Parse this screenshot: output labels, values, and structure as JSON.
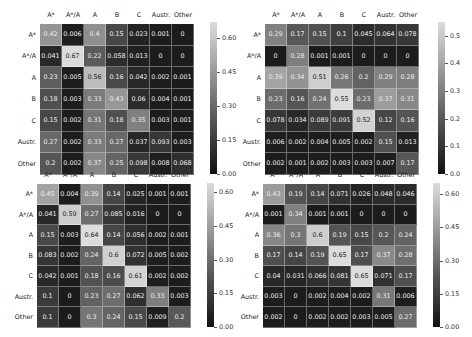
{
  "chart_data": [
    {
      "type": "heatmap",
      "position": "top-left",
      "x_labels": [
        "A*",
        "A*/A",
        "A",
        "B",
        "C",
        "Austr.",
        "Other"
      ],
      "y_labels": [
        "A*",
        "A*/A",
        "A",
        "B",
        "C",
        "Austr.",
        "Other"
      ],
      "values": [
        [
          0.42,
          0.006,
          0.4,
          0.15,
          0.023,
          0.001,
          0
        ],
        [
          0.041,
          0.67,
          0.22,
          0.058,
          0.013,
          0,
          0
        ],
        [
          0.23,
          0.005,
          0.56,
          0.16,
          0.042,
          0.002,
          0.001
        ],
        [
          0.18,
          0.003,
          0.33,
          0.43,
          0.06,
          0.004,
          0.001
        ],
        [
          0.15,
          0.002,
          0.31,
          0.18,
          0.35,
          0.003,
          0.001
        ],
        [
          0.27,
          0.002,
          0.33,
          0.27,
          0.037,
          0.093,
          0.003
        ],
        [
          0.2,
          0.002,
          0.37,
          0.25,
          0.098,
          0.008,
          0.068
        ]
      ],
      "colorbar_ticks": [
        "0.60",
        "0.45",
        "0.30",
        "0.15",
        "0.00"
      ],
      "vmin": 0,
      "vmax": 0.67
    },
    {
      "type": "heatmap",
      "position": "top-right",
      "x_labels": [
        "A*",
        "A*/A",
        "A",
        "B",
        "C",
        "Austr.",
        "Other"
      ],
      "y_labels": [
        "A*",
        "A*/A",
        "A",
        "B",
        "C",
        "Austr.",
        "Other"
      ],
      "values": [
        [
          0.29,
          0.17,
          0.15,
          0.1,
          0.045,
          0.064,
          0.078
        ],
        [
          0,
          0.28,
          0.001,
          0.001,
          0,
          0,
          0
        ],
        [
          0.39,
          0.34,
          0.51,
          0.26,
          0.2,
          0.29,
          0.28
        ],
        [
          0.23,
          0.16,
          0.24,
          0.55,
          0.23,
          0.37,
          0.31
        ],
        [
          0.078,
          0.034,
          0.089,
          0.091,
          0.52,
          0.12,
          0.16
        ],
        [
          0.006,
          0.002,
          0.004,
          0.005,
          0.002,
          0.15,
          0.013
        ],
        [
          0.002,
          0.001,
          0.002,
          0.003,
          0.003,
          0.007,
          0.17
        ]
      ],
      "colorbar_ticks": [
        "0.5",
        "0.4",
        "0.3",
        "0.2",
        "0.1",
        "0.0"
      ],
      "vmin": 0,
      "vmax": 0.55
    },
    {
      "type": "heatmap",
      "position": "bottom-left",
      "x_labels": [
        "A*",
        "A*/A",
        "A",
        "B",
        "C",
        "Austr.",
        "Other"
      ],
      "y_labels": [
        "A*",
        "A*/A",
        "A",
        "B",
        "C",
        "Austr.",
        "Other"
      ],
      "values": [
        [
          0.45,
          0.004,
          0.39,
          0.14,
          0.025,
          0.001,
          0.001
        ],
        [
          0.041,
          0.59,
          0.27,
          0.085,
          0.016,
          0,
          0
        ],
        [
          0.15,
          0.003,
          0.64,
          0.14,
          0.056,
          0.002,
          0.001
        ],
        [
          0.083,
          0.002,
          0.24,
          0.6,
          0.072,
          0.005,
          0.002
        ],
        [
          0.042,
          0.001,
          0.18,
          0.16,
          0.61,
          0.002,
          0.002
        ],
        [
          0.1,
          0,
          0.23,
          0.27,
          0.062,
          0.33,
          0.003
        ],
        [
          0.1,
          0,
          0.3,
          0.24,
          0.15,
          0.009,
          0.2
        ]
      ],
      "colorbar_ticks": [
        "0.60",
        "0.45",
        "0.30",
        "0.15",
        "0.00"
      ],
      "vmin": 0,
      "vmax": 0.64
    },
    {
      "type": "heatmap",
      "position": "bottom-right",
      "x_labels": [
        "A*",
        "A*/A",
        "A",
        "B",
        "C",
        "Austr.",
        "Other"
      ],
      "y_labels": [
        "A*",
        "A*/A",
        "A",
        "B",
        "C",
        "Austr.",
        "Other"
      ],
      "values": [
        [
          0.43,
          0.19,
          0.14,
          0.071,
          0.026,
          0.048,
          0.046
        ],
        [
          0.001,
          0.34,
          0.001,
          0.001,
          0,
          0,
          0
        ],
        [
          0.36,
          0.3,
          0.6,
          0.19,
          0.15,
          0.2,
          0.24
        ],
        [
          0.17,
          0.14,
          0.19,
          0.65,
          0.17,
          0.37,
          0.28
        ],
        [
          0.04,
          0.031,
          0.066,
          0.081,
          0.65,
          0.071,
          0.17
        ],
        [
          0.003,
          0,
          0.002,
          0.004,
          0.002,
          0.31,
          0.006
        ],
        [
          0.002,
          0,
          0.002,
          0.002,
          0.003,
          0.005,
          0.27
        ]
      ],
      "colorbar_ticks": [
        "0.60",
        "0.45",
        "0.30",
        "0.15",
        "0.00"
      ],
      "vmin": 0,
      "vmax": 0.65
    }
  ],
  "layout": [
    {
      "gx": 40,
      "gy": 24,
      "rowh": 21.5,
      "cbx": 210,
      "cbtop": 22,
      "cbh": 152
    },
    {
      "gx": 265,
      "gy": 24,
      "rowh": 21.5,
      "cbx": 438,
      "cbtop": 22,
      "cbh": 152
    },
    {
      "gx": 37,
      "gy": 184,
      "rowh": 20.5,
      "cbx": 207,
      "cbtop": 183,
      "cbh": 144
    },
    {
      "gx": 263,
      "gy": 184,
      "rowh": 20.5,
      "cbx": 433,
      "cbtop": 183,
      "cbh": 144
    }
  ]
}
